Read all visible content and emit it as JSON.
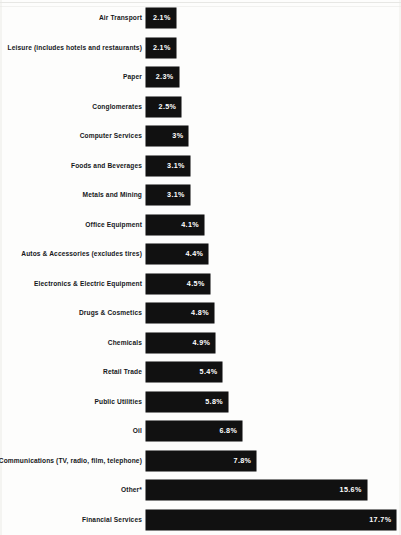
{
  "chart_data": {
    "type": "bar",
    "orientation": "horizontal",
    "title": "",
    "xlabel": "",
    "ylabel": "",
    "grid": false,
    "legend": false,
    "xlim": [
      0,
      17.7
    ],
    "value_suffix": "%",
    "categories": [
      "Air Transport",
      "Leisure (includes hotels and restaurants)",
      "Paper",
      "Conglomerates",
      "Computer Services",
      "Foods and Beverages",
      "Metals and Mining",
      "Office Equipment",
      "Autos & Accessories (excludes tires)",
      "Electronics & Electric Equipment",
      "Drugs & Cosmetics",
      "Chemicals",
      "Retail Trade",
      "Public Utilities",
      "Oil",
      "Communications (TV, radio, film, telephone)",
      "Other*",
      "Financial Services"
    ],
    "values": [
      2.1,
      2.1,
      2.3,
      2.5,
      3.0,
      3.1,
      3.1,
      4.1,
      4.4,
      4.5,
      4.8,
      4.9,
      5.4,
      5.8,
      6.8,
      7.8,
      15.6,
      17.7
    ],
    "value_labels": [
      "2.1%",
      "2.1%",
      "2.3%",
      "2.5%",
      "3%",
      "3.1%",
      "3.1%",
      "4.1%",
      "4.4%",
      "4.5%",
      "4.8%",
      "4.9%",
      "5.4%",
      "5.8%",
      "6.8%",
      "7.8%",
      "15.6%",
      "17.7%"
    ],
    "bar_color": "#111111",
    "value_label_color": "#ffffff",
    "category_label_color": "#15171a",
    "background_color": "#fdfdfc"
  },
  "layout": {
    "bar_origin_x": 146,
    "px_per_percent": 14.15,
    "first_bar_top": 8,
    "row_pitch": 29.5,
    "bar_height": 20
  }
}
